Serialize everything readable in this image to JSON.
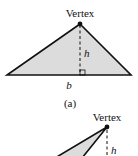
{
  "figure_a": {
    "vertex_label": "Vertex",
    "height_label": "h",
    "base_label": "b",
    "caption": "(a)",
    "fill_color": "#dcdcdc",
    "stroke_color": "#111111"
  },
  "figure_b": {
    "vertex_label": "Vertex",
    "height_label": "h",
    "fill_color": "#dcdcdc",
    "stroke_color": "#111111"
  }
}
